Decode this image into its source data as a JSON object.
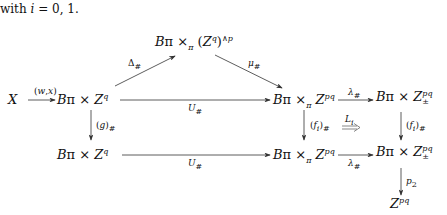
{
  "intro": {
    "line_faded": "",
    "line": "with i = 0, 1."
  },
  "nodes": {
    "X": "X",
    "top": "Bπ ×π (Zq)∧p",
    "row1_left": "Bπ × Zq",
    "row1_mid": "Bπ ×π Zpq",
    "row1_right": "Bπ × Zpq±",
    "row2_left": "Bπ × Zq",
    "row2_mid": "Bπ ×π Zpq",
    "row2_right": "Bπ × Zpq±",
    "bottom": "Zpq"
  },
  "arrow_labels": {
    "wx": "(w,x)",
    "delta": "Δ#",
    "mu": "μ#",
    "U_top": "U#",
    "U_bottom": "U#",
    "lambda_top": "λ#",
    "lambda_bottom": "λ#",
    "g": "(g)#",
    "fi_mid": "(fi)#",
    "fi_right": "(fi)#",
    "Li": "Li",
    "p2": "p2"
  }
}
